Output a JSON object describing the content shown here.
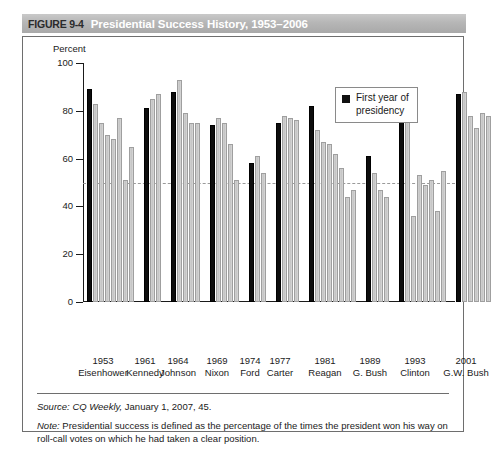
{
  "figure": {
    "number": "FIGURE 9-4",
    "title": "Presidential Success History, 1953–2006"
  },
  "legend": {
    "label": "First year of\npresidency",
    "swatch_color": "#111111"
  },
  "footer": {
    "source_label": "Source:",
    "source_italic": "CQ Weekly,",
    "source_rest": " January 1, 2007, 45.",
    "note_label": "Note:",
    "note_text": "  Presidential success is defined as the percentage of the times the president won his way on roll-call votes on which he had taken a clear position."
  },
  "chart_data": {
    "type": "bar",
    "title": "Presidential Success History, 1953–2006",
    "xlabel": "",
    "ylabel": "Percent",
    "ylim": [
      0,
      100
    ],
    "yticks": [
      0,
      20,
      40,
      60,
      80,
      100
    ],
    "ytick_labels": [
      "0",
      "20",
      "40",
      "60",
      "80",
      "100"
    ],
    "grid": false,
    "legend_position": "top-right",
    "reference_line": {
      "value": 50,
      "style": "dashed",
      "color": "#9a9a9a"
    },
    "bar_colors": {
      "first_year": "#0d0d0d",
      "other_years": "#c9c9c9"
    },
    "annotations": [
      "First year of presidency bars are shown in black"
    ],
    "categories": [
      "1953 Eisenhower",
      "1961 Kennedy",
      "1964 Johnson",
      "1969 Nixon",
      "1974 Ford",
      "1977 Carter",
      "1981 Reagan",
      "1989 G. Bush",
      "1993 Clinton",
      "2001 G.W. Bush"
    ],
    "groups": [
      {
        "year": "1953",
        "president": "Eisenhower",
        "values": [
          89,
          83,
          75,
          70,
          68,
          77,
          51,
          65
        ],
        "first_year_index": 0
      },
      {
        "year": "1961",
        "president": "Kennedy",
        "values": [
          81,
          85,
          87
        ],
        "first_year_index": 0
      },
      {
        "year": "1964",
        "president": "Johnson",
        "values": [
          88,
          93,
          79,
          75,
          75
        ],
        "first_year_index": 0
      },
      {
        "year": "1969",
        "president": "Nixon",
        "values": [
          74,
          77,
          75,
          66,
          51
        ],
        "first_year_index": 0
      },
      {
        "year": "1974",
        "president": "Ford",
        "values": [
          58,
          61,
          54
        ],
        "first_year_index": 0
      },
      {
        "year": "1977",
        "president": "Carter",
        "values": [
          75,
          78,
          77,
          76
        ],
        "first_year_index": 0
      },
      {
        "year": "1981",
        "president": "Reagan",
        "values": [
          82,
          72,
          67,
          66,
          62,
          56,
          44,
          47
        ],
        "first_year_index": 0
      },
      {
        "year": "1989",
        "president": "G. Bush",
        "values": [
          61,
          54,
          47,
          44
        ],
        "first_year_index": 0
      },
      {
        "year": "1993",
        "president": "Clinton",
        "values": [
          86,
          86,
          36,
          53,
          49,
          51,
          38,
          55
        ],
        "first_year_index": 0
      },
      {
        "year": "2001",
        "president": "G.W. Bush",
        "values": [
          87,
          88,
          78,
          73,
          79,
          78
        ],
        "first_year_index": 0
      }
    ]
  }
}
